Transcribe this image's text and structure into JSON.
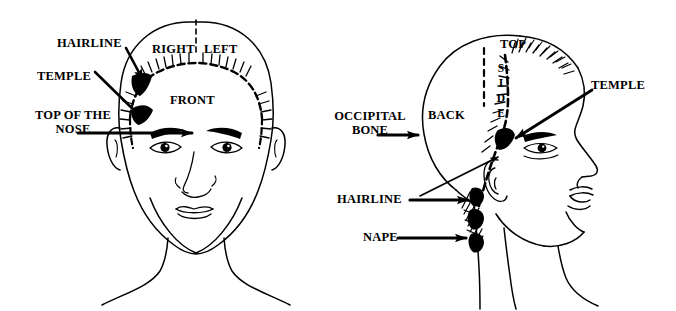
{
  "page": {
    "background_color": "#ffffff",
    "ink_color": "#000000",
    "width": 676,
    "height": 311
  },
  "figures": {
    "front_view": {
      "name": "Front view of head",
      "region_labels": {
        "right": "RIGHT",
        "left": "LEFT",
        "front": "FRONT"
      },
      "callouts": [
        {
          "id": "hairline",
          "label": "HAIRLINE"
        },
        {
          "id": "temple",
          "label": "TEMPLE"
        },
        {
          "id": "top_of_the_nose",
          "line1": "TOP OF THE",
          "line2": "NOSE"
        }
      ]
    },
    "side_view": {
      "name": "Profile view of head",
      "region_labels": {
        "top": "TOP",
        "back": "BACK",
        "side_letters": [
          "S",
          "I",
          "D",
          "E"
        ],
        "side_word": "SIDE"
      },
      "callouts": [
        {
          "id": "occipital_bone",
          "line1": "OCCIPITAL",
          "line2": "BONE"
        },
        {
          "id": "temple",
          "label": "TEMPLE"
        },
        {
          "id": "hairline",
          "label": "HAIRLINE"
        },
        {
          "id": "nape",
          "label": "NAPE"
        }
      ]
    }
  }
}
